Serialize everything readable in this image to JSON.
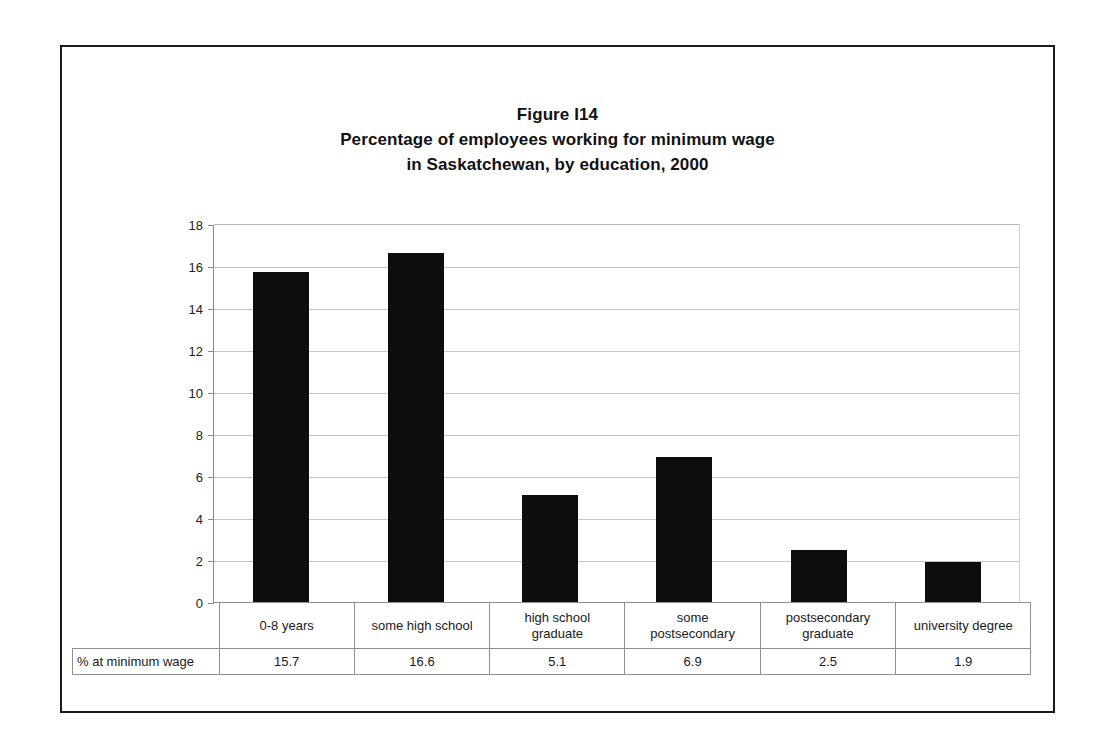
{
  "figure": {
    "title_lines": [
      "Figure I14",
      "Percentage of employees working for minimum wage",
      "in Saskatchewan, by education, 2000"
    ]
  },
  "chart_data": {
    "type": "bar",
    "xlabel": "",
    "ylabel": "",
    "ylim": [
      0,
      18
    ],
    "ytick_labels": [
      "18",
      "16",
      "14",
      "12",
      "10",
      "8",
      "6",
      "4",
      "2",
      "0"
    ],
    "ytick_values": [
      18,
      16,
      14,
      12,
      10,
      8,
      6,
      4,
      2,
      0
    ],
    "grid": true,
    "legend": false,
    "bar_color": "#0d0d0d",
    "grid_color": "#c6c6c6",
    "axis_color": "#8a8a8a",
    "categories": [
      "0-8 years",
      "some high school",
      "high school graduate",
      "some postsecondary",
      "postsecondary graduate",
      "university degree"
    ],
    "category_lines": [
      [
        "0-8 years"
      ],
      [
        "some high school"
      ],
      [
        "high school",
        "graduate"
      ],
      [
        "some",
        "postsecondary"
      ],
      [
        "postsecondary",
        "graduate"
      ],
      [
        "university degree"
      ]
    ],
    "values": [
      15.7,
      16.6,
      5.1,
      6.9,
      2.5,
      1.9
    ],
    "value_labels": [
      "15.7",
      "16.6",
      "5.1",
      "6.9",
      "2.5",
      "1.9"
    ],
    "series_label": "% at minimum wage"
  }
}
